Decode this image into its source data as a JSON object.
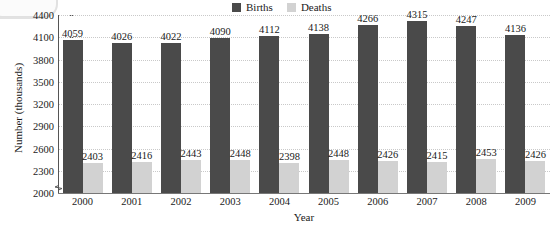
{
  "chart_data": {
    "type": "bar",
    "title": "",
    "xlabel": "Year",
    "ylabel": "Number (thousands)",
    "categories": [
      "2000",
      "2001",
      "2002",
      "2003",
      "2004",
      "2005",
      "2006",
      "2007",
      "2008",
      "2009"
    ],
    "series": [
      {
        "name": "Births",
        "color": "#4a4a4a",
        "values": [
          4059,
          4026,
          4022,
          4090,
          4112,
          4138,
          4266,
          4315,
          4247,
          4136
        ]
      },
      {
        "name": "Deaths",
        "color": "#d2d2d2",
        "values": [
          2403,
          2416,
          2443,
          2448,
          2398,
          2448,
          2426,
          2415,
          2453,
          2426
        ]
      }
    ],
    "ylim": [
      2000,
      4400
    ],
    "ytick_values": [
      2000,
      2300,
      2600,
      2900,
      3200,
      3500,
      3800,
      4100,
      4400
    ],
    "ytick_labels": [
      "2000",
      "2300",
      "2600",
      "2900",
      "3200",
      "3500",
      "3800",
      "4100",
      "4400"
    ],
    "ytick_step": 300,
    "axis_break": true,
    "grid": "horizontal-dotted",
    "legend_position": "top-center",
    "data_labels": true
  },
  "legend": {
    "entries": [
      {
        "label": "Births",
        "color": "#4a4a4a",
        "swatch_name": "births-swatch"
      },
      {
        "label": "Deaths",
        "color": "#d2d2d2",
        "swatch_name": "deaths-swatch"
      }
    ]
  },
  "axes": {
    "y_title": "Number (thousands)",
    "x_title": "Year"
  },
  "colors": {
    "births": "#4a4a4a",
    "deaths": "#d2d2d2",
    "grid": "#c9c9c9",
    "axis": "#555555",
    "text": "#1a1a1a",
    "background": "#ffffff"
  }
}
